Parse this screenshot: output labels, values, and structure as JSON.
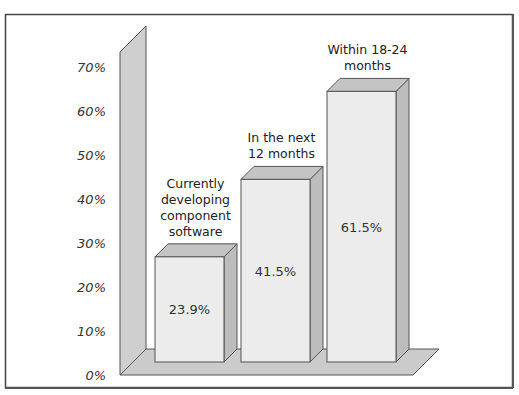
{
  "chart_data": {
    "type": "bar",
    "title": "",
    "xlabel": "",
    "ylabel": "",
    "ylim": [
      0,
      70
    ],
    "yticks": [
      "0%",
      "10%",
      "20%",
      "30%",
      "40%",
      "50%",
      "60%",
      "70%"
    ],
    "grid": false,
    "style": "3d",
    "categories": [
      "Currently developing component software",
      "In the next 12 months",
      "Within 18-24 months"
    ],
    "category_label_lines": [
      [
        "Currently",
        "developing",
        "component",
        "software"
      ],
      [
        "In the next",
        "12 months"
      ],
      [
        "Within 18-24",
        "months"
      ]
    ],
    "values": [
      23.9,
      41.5,
      61.5
    ],
    "value_labels": [
      "23.9%",
      "41.5%",
      "61.5%"
    ]
  },
  "colors": {
    "bar_front": "#ececec",
    "bar_top": "#c4c4c4",
    "bar_side": "#bdbdbd",
    "wall": "#cfcfcf",
    "floor": "#cbcbcb",
    "frame": "#444444",
    "outline": "#555555"
  }
}
